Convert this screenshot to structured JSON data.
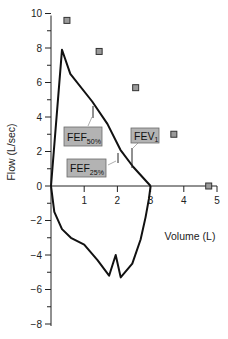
{
  "chart_data": {
    "type": "line",
    "title": "",
    "xlabel": "Volume (L)",
    "ylabel": "Flow (L/sec)",
    "xlim": [
      0,
      5
    ],
    "ylim": [
      -8,
      10
    ],
    "grid": false,
    "legend": null,
    "x_ticks": [
      1,
      2,
      3,
      4,
      5
    ],
    "y_ticks": [
      10,
      8,
      6,
      4,
      2,
      0,
      -2,
      -4,
      -6,
      -8
    ],
    "y_tick_labels": [
      "10",
      "8",
      "6",
      "4",
      "2",
      "0",
      "−2",
      "−4",
      "−6",
      "−8"
    ],
    "x_tick_labels": [
      "1",
      "2",
      "3",
      "4",
      "5"
    ],
    "series": [
      {
        "name": "Expiratory flow-volume curve",
        "points": [
          [
            0,
            0
          ],
          [
            0.33,
            7.9
          ],
          [
            0.58,
            6.5
          ],
          [
            1.24,
            4.9
          ],
          [
            1.7,
            3.6
          ],
          [
            2.09,
            2.1
          ],
          [
            2.48,
            1.1
          ],
          [
            3.0,
            0
          ]
        ]
      },
      {
        "name": "Inspiratory flow-volume curve",
        "points": [
          [
            0,
            0
          ],
          [
            0.1,
            -1.5
          ],
          [
            0.33,
            -2.5
          ],
          [
            0.6,
            -3.0
          ],
          [
            1.0,
            -3.4
          ],
          [
            1.4,
            -4.3
          ],
          [
            1.75,
            -5.2
          ],
          [
            1.95,
            -4.0
          ],
          [
            2.1,
            -5.3
          ],
          [
            2.45,
            -4.5
          ],
          [
            2.7,
            -3.1
          ],
          [
            2.85,
            -1.8
          ],
          [
            2.95,
            -0.75
          ],
          [
            3.0,
            0
          ]
        ]
      },
      {
        "name": "Predicted values (markers)",
        "marker": "square",
        "points": [
          [
            0.48,
            9.6
          ],
          [
            1.45,
            7.8
          ],
          [
            2.55,
            5.7
          ],
          [
            3.7,
            3.0
          ],
          [
            4.75,
            0
          ]
        ]
      }
    ],
    "annotations": [
      {
        "label": "FEF",
        "subscript": "50%",
        "at": [
          1.25,
          4.9
        ]
      },
      {
        "label": "FEF",
        "subscript": "25%",
        "at": [
          2.0,
          2.3
        ]
      },
      {
        "label": "FEV",
        "subscript": "1",
        "at": [
          2.45,
          1.3
        ]
      }
    ]
  },
  "labels": {
    "xlabel": "Volume (L)",
    "ylabel": "Flow (L/sec)",
    "fef50": {
      "main": "FEF",
      "sub": "50%"
    },
    "fef25": {
      "main": "FEF",
      "sub": "25%"
    },
    "fev1": {
      "main": "FEV",
      "sub": "1"
    }
  },
  "colors": {
    "curve": "#111111",
    "marker_fill": "#9a9a9a",
    "marker_stroke": "#333333",
    "annotation_box": "#b3b3b3"
  }
}
